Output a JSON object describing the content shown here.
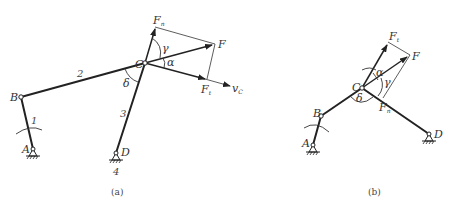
{
  "figure_a": {
    "caption": "(a)",
    "points": {
      "A": {
        "label": "A",
        "x": 33,
        "y": 149
      },
      "B": {
        "label": "B",
        "x": 21,
        "y": 97
      },
      "C": {
        "label": "C",
        "x": 145,
        "y": 63
      },
      "D": {
        "label": "D",
        "x": 116,
        "y": 153
      }
    },
    "links": {
      "l1": "1",
      "l2": "2",
      "l3": "3",
      "l4": "4"
    },
    "forces": {
      "F": "F",
      "Fn": "F",
      "Fn_sub": "n",
      "Ft": "F",
      "Ft_sub": "t",
      "vC": "v",
      "vC_sub": "C"
    },
    "angles": {
      "alpha": "α",
      "gamma": "γ",
      "delta": "δ"
    }
  },
  "figure_b": {
    "caption": "(b)",
    "points": {
      "A": {
        "label": "A",
        "x": 313,
        "y": 145
      },
      "B": {
        "label": "B",
        "x": 321,
        "y": 116
      },
      "C": {
        "label": "C",
        "x": 362,
        "y": 88
      },
      "D": {
        "label": "D",
        "x": 429,
        "y": 134
      }
    },
    "forces": {
      "F": "F",
      "Fn": "F",
      "Fn_sub": "n",
      "Ft": "F",
      "Ft_sub": "t"
    },
    "angles": {
      "alpha": "α",
      "gamma": "γ",
      "delta": "δ"
    }
  }
}
